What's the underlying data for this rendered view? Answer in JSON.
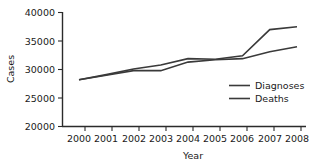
{
  "chart_data": {
    "type": "line",
    "title": "",
    "xlabel": "Year",
    "ylabel": "Cases",
    "x": [
      2000,
      2001,
      2002,
      2003,
      2004,
      2005,
      2006,
      2007,
      2008
    ],
    "xtick_labels": [
      "2000",
      "2001",
      "2002",
      "2003",
      "2004",
      "2005",
      "2006",
      "2007",
      "2008"
    ],
    "ytick_labels": [
      "20000",
      "25000",
      "30000",
      "35000",
      "40000"
    ],
    "yticks": [
      20000,
      25000,
      30000,
      35000,
      40000
    ],
    "ylim": [
      20000,
      40000
    ],
    "xlim": [
      2000,
      2008
    ],
    "grid": false,
    "legend_position": "lower-right",
    "series": [
      {
        "name": "Diagnoses",
        "values": [
          28200,
          29100,
          30100,
          30800,
          31900,
          31800,
          32400,
          37000,
          37500
        ]
      },
      {
        "name": "Deaths",
        "values": [
          28200,
          29000,
          29800,
          29800,
          31300,
          31700,
          31900,
          33100,
          34000
        ]
      }
    ]
  },
  "legend": {
    "entries": [
      {
        "label": "Diagnoses"
      },
      {
        "label": "Deaths"
      }
    ]
  },
  "axes": {
    "y_axis_title": "Cases",
    "x_axis_title": "Year"
  }
}
